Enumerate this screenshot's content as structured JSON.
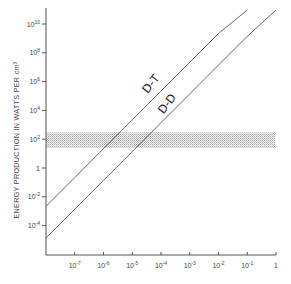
{
  "chart_data": {
    "type": "line",
    "title": "",
    "xlabel": "",
    "ylabel": "ENERGY PRODUCTION IN WATTS PER cm³",
    "xscale": "log",
    "yscale": "log",
    "xlim": [
      1e-08,
      1
    ],
    "ylim": [
      1e-06,
      100000000000.0
    ],
    "grid": false,
    "x_ticks": [
      {
        "value": 1e-07,
        "base": "10",
        "exp": "-7"
      },
      {
        "value": 1e-06,
        "base": "10",
        "exp": "-6"
      },
      {
        "value": 1e-05,
        "base": "10",
        "exp": "-5"
      },
      {
        "value": 0.0001,
        "base": "10",
        "exp": "-4"
      },
      {
        "value": 0.001,
        "base": "10",
        "exp": "-3"
      },
      {
        "value": 0.01,
        "base": "10",
        "exp": "-2"
      },
      {
        "value": 0.1,
        "base": "10",
        "exp": "-1"
      },
      {
        "value": 1,
        "base": "1",
        "exp": ""
      }
    ],
    "y_ticks": [
      {
        "value": 10000000000.0,
        "base": "10",
        "exp": "10"
      },
      {
        "value": 100000000.0,
        "base": "10",
        "exp": "8"
      },
      {
        "value": 1000000.0,
        "base": "10",
        "exp": "6"
      },
      {
        "value": 10000.0,
        "base": "10",
        "exp": "4"
      },
      {
        "value": 100.0,
        "base": "10",
        "exp": "2"
      },
      {
        "value": 1,
        "base": "1",
        "exp": ""
      },
      {
        "value": 0.01,
        "base": "10",
        "exp": "-2"
      },
      {
        "value": 0.0001,
        "base": "10",
        "exp": "-4"
      }
    ],
    "series": [
      {
        "name": "D-T",
        "label": "D-T",
        "x": [
          1e-08,
          1e-07,
          1e-06,
          1e-05,
          0.0001,
          0.001,
          0.01,
          0.1
        ],
        "values": [
          0.0022,
          0.22,
          22.0,
          2200.0,
          220000.0,
          22000000.0,
          2200000000.0,
          150000000000.0
        ],
        "label_pos": {
          "x": 154,
          "y": 86
        }
      },
      {
        "name": "D-D",
        "label": "D-D",
        "x": [
          1e-08,
          1e-07,
          1e-06,
          1e-05,
          0.0001,
          0.001,
          0.01,
          0.1,
          1
        ],
        "values": [
          1.4e-05,
          0.0014,
          0.14,
          14.0,
          1400.0,
          140000.0,
          14000000.0,
          1400000000.0,
          100000000000.0
        ],
        "label_pos": {
          "x": 170,
          "y": 106
        }
      }
    ],
    "annotations": [
      {
        "type": "shaded_band",
        "y_range": [
          25,
          300
        ],
        "x_range": [
          1e-08,
          0.95
        ],
        "description": "stippled horizontal band around 10^2 W/cm³"
      }
    ]
  }
}
